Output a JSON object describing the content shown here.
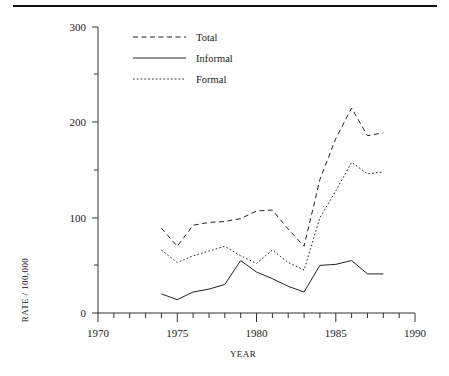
{
  "figure": {
    "name": "line-chart-rate-per-100000-by-year",
    "has_top_rule": true
  },
  "chart_data": {
    "type": "line",
    "title": "",
    "subtitle": "",
    "xlabel": "YEAR",
    "ylabel": "RATE / 100,000",
    "xlim": [
      1970,
      1990
    ],
    "ylim": [
      0,
      300
    ],
    "x_ticks_major": [
      1970,
      1975,
      1980,
      1985,
      1990
    ],
    "x_tick_labels": [
      "1970",
      "1975",
      "1980",
      "1985",
      "1990"
    ],
    "x_ticks_minor_step": 1,
    "y_ticks_major": [
      0,
      100,
      200,
      300
    ],
    "y_tick_labels": [
      "0",
      "100",
      "200",
      "300"
    ],
    "y_ticks_minor": [
      50,
      150,
      250
    ],
    "grid": false,
    "legend_position": "top-left-inside",
    "x": [
      1974,
      1975,
      1976,
      1977,
      1978,
      1979,
      1980,
      1981,
      1982,
      1983,
      1984,
      1985,
      1986,
      1987,
      1988
    ],
    "series": [
      {
        "name": "Total",
        "style": "dashed",
        "color": "#222222",
        "values": [
          89,
          70,
          92,
          95,
          96,
          99,
          107,
          108,
          88,
          70,
          140,
          183,
          215,
          186,
          189
        ]
      },
      {
        "name": "Informal",
        "style": "solid",
        "color": "#222222",
        "values": [
          20,
          14,
          22,
          25,
          30,
          55,
          43,
          36,
          28,
          22,
          50,
          51,
          55,
          41,
          41
        ]
      },
      {
        "name": "Formal",
        "style": "dotted",
        "color": "#222222",
        "values": [
          66,
          53,
          60,
          65,
          70,
          60,
          52,
          66,
          53,
          45,
          100,
          128,
          158,
          146,
          148
        ]
      }
    ]
  },
  "axes": {
    "y_label": "RATE / 100,000",
    "x_label": "YEAR",
    "y_tick_labels": [
      "300",
      "200",
      "100",
      "0"
    ],
    "x_tick_labels": [
      "1970",
      "1975",
      "1980",
      "1985",
      "1990"
    ]
  },
  "legend": {
    "entries": [
      {
        "label": "Total",
        "style": "dashed"
      },
      {
        "label": "Informal",
        "style": "solid"
      },
      {
        "label": "Formal",
        "style": "dotted"
      }
    ]
  }
}
